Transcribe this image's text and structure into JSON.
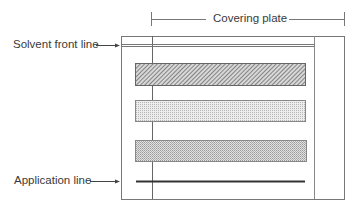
{
  "diagram": {
    "labels": {
      "covering_plate": "Covering plate",
      "solvent_front": "Solvent front line",
      "application": "Application line"
    },
    "elements": {
      "plate": {
        "name": "TLC plate",
        "x": 121,
        "y": 36,
        "w": 223,
        "h": 163
      },
      "covering_plate": {
        "name": "Covering plate",
        "x_left": 152,
        "x_right": 314
      },
      "solvent_front_line": {
        "y": 45,
        "x1": 121,
        "x2": 315
      },
      "application_line": {
        "y": 181,
        "x1": 136,
        "x2": 305
      },
      "bands": [
        {
          "name": "band-1",
          "pattern": "diagonal-hatch",
          "x": 135,
          "y": 63,
          "w": 170,
          "h": 22
        },
        {
          "name": "band-2",
          "pattern": "light-dots",
          "x": 135,
          "y": 100,
          "w": 170,
          "h": 21
        },
        {
          "name": "band-3",
          "pattern": "dense-dots",
          "x": 135,
          "y": 140,
          "w": 171,
          "h": 21
        }
      ]
    },
    "colors": {
      "line": "#555555",
      "band_stroke": "#777777",
      "hatch": "#6a6a6a",
      "dot": "#9a9a9a"
    }
  }
}
